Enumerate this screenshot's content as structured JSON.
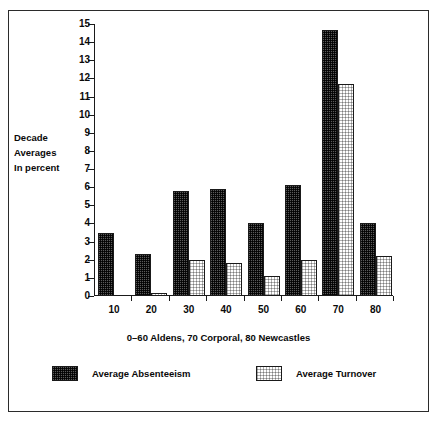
{
  "chart_data": {
    "type": "bar",
    "title": "",
    "subtitle": "",
    "xlabel": "0–60 Aldens, 70 Corporal, 80 Newcastles",
    "ylabel": "Decade Averages In percent",
    "ylabel_lines": [
      "Decade",
      "Averages",
      "In  percent"
    ],
    "categories": [
      "10",
      "20",
      "30",
      "40",
      "50",
      "60",
      "70",
      "80"
    ],
    "series": [
      {
        "name": "Average Absenteeism",
        "values": [
          3.45,
          2.3,
          5.8,
          5.9,
          4.05,
          6.1,
          14.65,
          4.05
        ],
        "fill": "dark-checker",
        "color": "#5a5a5a"
      },
      {
        "name": "Average Turnover",
        "values": [
          0,
          0.15,
          2.0,
          1.8,
          1.1,
          2.0,
          11.7,
          2.2
        ],
        "fill": "light-checker",
        "color": "#e8e8e8"
      }
    ],
    "ylim": [
      0,
      15
    ],
    "ytick_labels": [
      "0",
      "1",
      "2",
      "3",
      "4",
      "5",
      "6",
      "7",
      "8",
      "9",
      "10",
      "11",
      "12",
      "13",
      "14",
      "15"
    ],
    "ytick_values": [
      0,
      1,
      2,
      3,
      4,
      5,
      6,
      7,
      8,
      9,
      10,
      11,
      12,
      13,
      14,
      15
    ],
    "grid": false,
    "legend_position": "bottom",
    "axis_color": "#1a1a1a",
    "background": "#ffffff"
  },
  "legend": {
    "entries": [
      {
        "label": "Average Absenteeism",
        "swatch": "dark-checker"
      },
      {
        "label": "Average Turnover",
        "swatch": "light-checker"
      }
    ]
  }
}
